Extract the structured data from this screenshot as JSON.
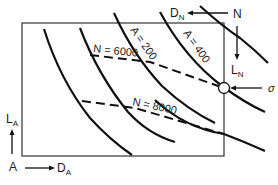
{
  "diagram": {
    "curves_A": [
      {
        "label": "A = 200"
      },
      {
        "label": "A = 400"
      }
    ],
    "curves_N": [
      {
        "label": "N = 6000"
      },
      {
        "label": "N = 8000"
      }
    ],
    "point_label": "σ",
    "axes": {
      "origin_A": "A",
      "D_A": "D",
      "D_A_sub": "A",
      "L_A": "L",
      "L_A_sub": "A",
      "origin_N": "N",
      "D_N": "D",
      "D_N_sub": "N",
      "L_N": "L",
      "L_N_sub": "N"
    },
    "colors": {
      "line": "#111111",
      "frame": "#333333"
    }
  }
}
